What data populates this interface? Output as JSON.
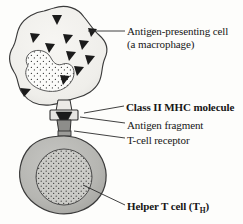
{
  "figure": {
    "background_color": "#fdfdfb"
  },
  "labels": {
    "apc_line1": "Antigen-presenting cell",
    "apc_line2": "(a macrophage)",
    "mhc": "Class II MHC molecule",
    "antigen_fragment": "Antigen fragment",
    "tcell_receptor": "T-cell receptor",
    "helper_t_cell_pre": "Helper T cell (T",
    "helper_t_cell_sub": "H",
    "helper_t_cell_post": ")"
  },
  "structures": {
    "macrophage": {
      "name": "Antigen-presenting cell (a macrophage)",
      "fill_color": "#f2f1ee",
      "stroke_color": "#3a3a3a",
      "nucleus": {
        "name": "macrophage-nucleus",
        "shape": "kidney",
        "fill_color": "#fbfbf9",
        "stipple": true
      },
      "antigen_triangles_count": 11,
      "triangle_color": "#1b1b1b"
    },
    "helper_t_cell": {
      "name": "Helper T cell (TH)",
      "fill_color": "#b9b9b6",
      "stroke_color": "#3a3a3a",
      "nucleus": {
        "name": "t-cell-nucleus",
        "shape": "circle",
        "fill_color": "#c9c9c5",
        "stipple": true
      }
    },
    "mhc_molecule": {
      "name": "Class II MHC molecule",
      "fill_color": "#e6e5e2",
      "stroke_color": "#2f2f2f"
    },
    "antigen_fragment": {
      "name": "Antigen fragment",
      "shape": "triangle",
      "fill_color": "#1b1b1b"
    },
    "tcell_receptor": {
      "name": "T-cell receptor",
      "fill_color": "#8d8d8a",
      "stroke_color": "#2f2f2f"
    }
  },
  "leader_lines": [
    {
      "name": "leader-apc",
      "from": [
        125,
        31
      ],
      "to": [
        88,
        31
      ]
    },
    {
      "name": "leader-mhc",
      "from": [
        124,
        107
      ],
      "to": [
        84,
        112
      ]
    },
    {
      "name": "leader-frag",
      "from": [
        125,
        124
      ],
      "to": [
        79,
        117
      ]
    },
    {
      "name": "leader-tcr",
      "from": [
        125,
        139
      ],
      "to": [
        76,
        130
      ]
    },
    {
      "name": "leader-th",
      "from": [
        125,
        205
      ],
      "to": [
        83,
        186
      ]
    }
  ]
}
